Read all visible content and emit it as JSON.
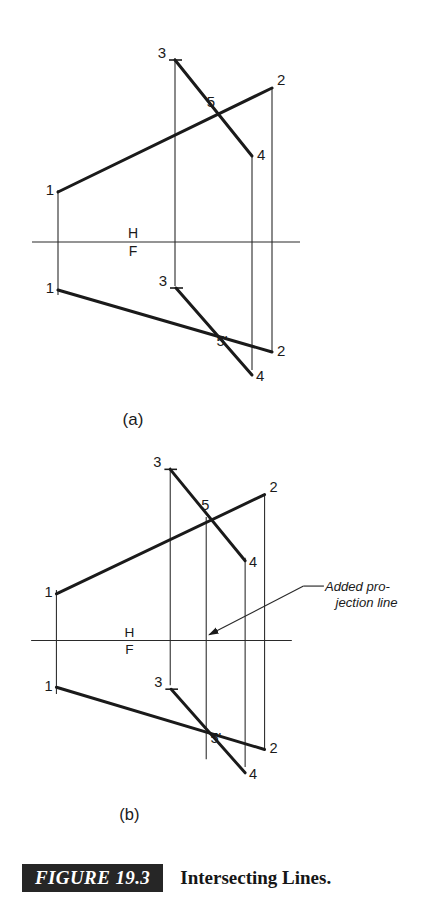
{
  "figure": {
    "tag": "FIGURE 19.3",
    "caption": "Intersecting Lines.",
    "tag_bg": "#262626",
    "tag_fg": "#ffffff",
    "ink": "#1a1a1a",
    "background": "#ffffff"
  },
  "panels": [
    {
      "key": "a",
      "sublabel": "(a)",
      "reference_line": {
        "label_top": "H",
        "label_bottom": "F"
      },
      "point_labels": {
        "line12_h_start": "1",
        "line12_h_end": "2",
        "line34_h_start": "3",
        "line34_h_end": "4",
        "intersection_h": "5",
        "line12_f_start": "1",
        "line12_f_end": "2",
        "line34_f_start": "3",
        "line34_f_end": "4",
        "intersection_f": "5'"
      }
    },
    {
      "key": "b",
      "sublabel": "(b)",
      "reference_line": {
        "label_top": "H",
        "label_bottom": "F"
      },
      "point_labels": {
        "line12_h_start": "1",
        "line12_h_end": "2",
        "line34_h_start": "3",
        "line34_h_end": "4",
        "intersection_h": "5",
        "line12_f_start": "1",
        "line12_f_end": "2",
        "line34_f_start": "3",
        "line34_f_end": "4",
        "intersection_f": "5'"
      },
      "annotation": {
        "line1": "Added pro-",
        "line2": "jection line"
      }
    }
  ]
}
